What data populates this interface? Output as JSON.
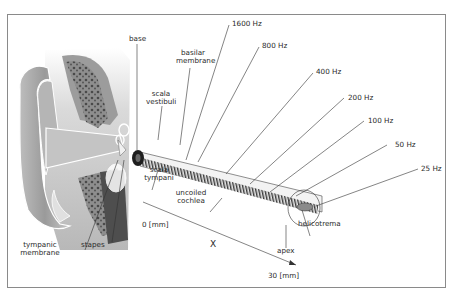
{
  "diagram": {
    "labels": {
      "base": "base",
      "basilar_membrane_1": "basilar",
      "basilar_membrane_2": "membrane",
      "scala_vestibuli_1": "scala",
      "scala_vestibuli_2": "vestibuli",
      "scala_tympani_1": "scala",
      "scala_tympani_2": "tympani",
      "uncoiled_cochlea_1": "uncoiled",
      "uncoiled_cochlea_2": "cochlea",
      "tympanic_membrane_1": "tympanic",
      "tympanic_membrane_2": "membrane",
      "stapes": "stapes",
      "apex": "apex",
      "helicotrema": "helicotrema"
    },
    "frequencies": [
      {
        "label": "1600 Hz"
      },
      {
        "label": "800 Hz"
      },
      {
        "label": "400 Hz"
      },
      {
        "label": "200 Hz"
      },
      {
        "label": "100 Hz"
      },
      {
        "label": "50 Hz"
      },
      {
        "label": "25 Hz"
      }
    ],
    "axis": {
      "start": "0 [mm]",
      "end": "30 [mm]",
      "variable": "X"
    },
    "colors": {
      "frame": "#8a8a8a",
      "line": "#333333",
      "ear_light": "#d8d8d8",
      "ear_mid": "#a8a8a8",
      "ear_dark": "#5a5a5a"
    }
  }
}
